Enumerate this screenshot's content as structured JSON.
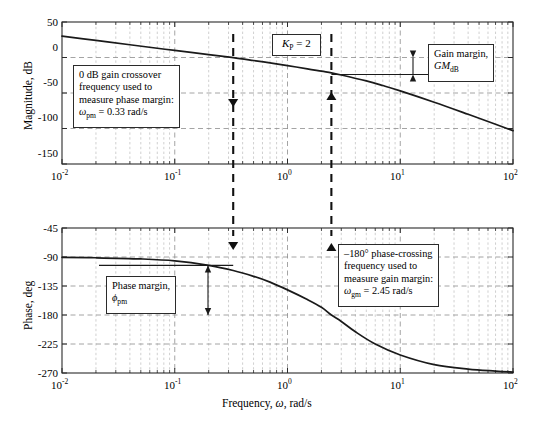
{
  "figure": {
    "type": "bode-plot",
    "xlabel_parts": {
      "pre": "Frequency, ",
      "sym": "ω",
      "post": ", rad/s"
    }
  },
  "chart_data": [
    {
      "type": "line",
      "name": "magnitude",
      "title": "",
      "xlabel": "Frequency, ω, rad/s",
      "ylabel": "Magnitude, dB",
      "xscale": "log",
      "xlim": [
        0.01,
        100
      ],
      "ylim": [
        -150,
        50
      ],
      "grid": true,
      "xticks": [
        0.01,
        0.1,
        1,
        10,
        100
      ],
      "xticklabels": [
        "10⁻²",
        "10⁻¹",
        "10⁰",
        "10¹",
        "10²"
      ],
      "yticks": [
        50,
        0,
        -50,
        -100,
        -150
      ],
      "yticklabels": [
        "50",
        "0",
        "-50",
        "-100",
        "-150"
      ],
      "x": [
        0.01,
        0.02,
        0.04,
        0.07,
        0.1,
        0.2,
        0.33,
        0.5,
        0.7,
        1.0,
        1.5,
        2.0,
        2.45,
        3.0,
        5.0,
        7.0,
        10.0,
        20.0,
        40.0,
        70.0,
        100.0
      ],
      "y": [
        30.0,
        24.0,
        18.0,
        13.0,
        10.0,
        4.0,
        -0.2,
        -4.2,
        -7.6,
        -11.5,
        -15.9,
        -19.3,
        -21.6,
        -24.6,
        -33.0,
        -39.5,
        -47.0,
        -63.0,
        -80.0,
        -94.0,
        -103.0
      ]
    },
    {
      "type": "line",
      "name": "phase",
      "title": "",
      "xlabel": "Frequency, ω, rad/s",
      "ylabel": "Phase, deg",
      "xscale": "log",
      "xlim": [
        0.01,
        100
      ],
      "ylim": [
        -270,
        -45
      ],
      "grid": true,
      "xticks": [
        0.01,
        0.1,
        1,
        10,
        100
      ],
      "xticklabels": [
        "10⁻²",
        "10⁻¹",
        "10⁰",
        "10¹",
        "10²"
      ],
      "yticks": [
        -45,
        -90,
        -135,
        -180,
        -225,
        -270
      ],
      "yticklabels": [
        "-45",
        "-90",
        "-135",
        "-180",
        "-225",
        "-270"
      ],
      "x": [
        0.01,
        0.02,
        0.05,
        0.1,
        0.2,
        0.33,
        0.5,
        0.7,
        1.0,
        1.5,
        2.0,
        2.45,
        3.0,
        4.0,
        6.0,
        10.0,
        20.0,
        40.0,
        70.0,
        100.0
      ],
      "y": [
        -90.5,
        -91.2,
        -93.0,
        -96.0,
        -103.0,
        -111.0,
        -120.0,
        -129.0,
        -141.0,
        -156.0,
        -168.0,
        -180.0,
        -190.0,
        -206.0,
        -225.0,
        -242.0,
        -257.0,
        -264.0,
        -267.0,
        -268.5
      ]
    }
  ],
  "markers": {
    "phase_margin_frequency": {
      "omega": 0.33,
      "label": "ωpm = 0.33 rad/s"
    },
    "gain_margin_frequency": {
      "omega": 2.45,
      "label": "ωgm = 2.45 rad/s"
    },
    "gain_margin_db": -24,
    "phase_margin_deg": 77
  },
  "axes": {
    "magnitude": {
      "ylabel": "Magnitude, dB",
      "yticks": [
        "50",
        "0",
        "-50",
        "-100",
        "-150"
      ],
      "xticks": [
        "10",
        "10",
        "10",
        "10",
        "10"
      ],
      "xtick_exponents": [
        "-2",
        "-1",
        "0",
        "1",
        "2"
      ]
    },
    "phase": {
      "ylabel": "Phase, deg",
      "yticks": [
        "-45",
        "-90",
        "-135",
        "-180",
        "-225",
        "-270"
      ],
      "xticks": [
        "10",
        "10",
        "10",
        "10",
        "10"
      ],
      "xtick_exponents": [
        "-2",
        "-1",
        "0",
        "1",
        "2"
      ]
    }
  },
  "annotations": {
    "kp": {
      "sym": "K",
      "sub": "P",
      "eq": " = 2"
    },
    "gain_margin_box": {
      "line1": "Gain margin,",
      "gm": "GM",
      "gm_sub": "dB"
    },
    "crossover_box": {
      "line1": "0 dB gain crossover",
      "line2": "frequency used to",
      "line3": "measure phase margin:",
      "omega": "ω",
      "omega_sub": "pm",
      "value": " = 0.33 rad/s"
    },
    "phase_margin_box": {
      "line1": "Phase margin,",
      "phi": "ϕ",
      "phi_sub": "pm"
    },
    "phase_crossing_box": {
      "line1": "–180° phase-crossing",
      "line2": "frequency used to",
      "line3": "measure gain margin:",
      "omega": "ω",
      "omega_sub": "gm",
      "value": " = 2.45 rad/s"
    }
  },
  "colors": {
    "curve": "#1a1a1a",
    "frame": "#2b2b2b",
    "grid": "#b0b0b0",
    "dashed_marker": "#111111",
    "background": "#ffffff"
  }
}
